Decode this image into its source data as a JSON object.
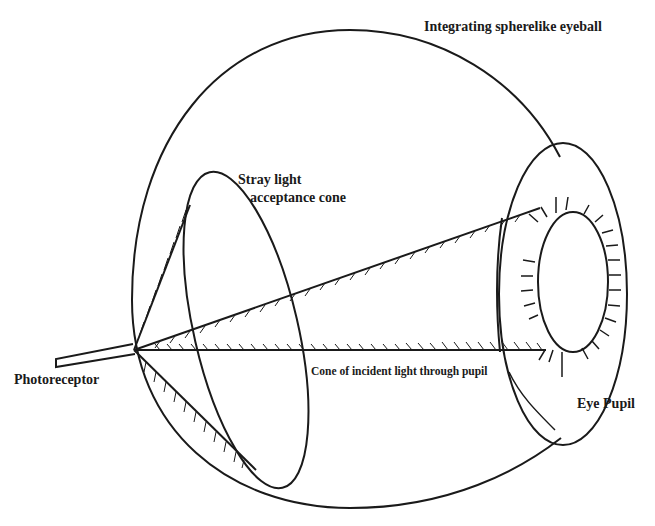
{
  "figure": {
    "labels": {
      "eyeball": "Integrating spherelike eyeball",
      "stray_cone_line1": "Stray light",
      "stray_cone_line2": "acceptance cone",
      "photoreceptor": "Photoreceptor",
      "incident_cone": "Cone of incident light through pupil",
      "pupil": "Eye Pupil"
    },
    "colors": {
      "ink": "#1a1a1a",
      "background": "#ffffff"
    }
  }
}
